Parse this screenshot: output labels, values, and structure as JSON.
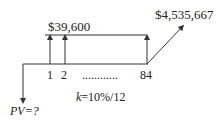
{
  "diagram": {
    "type": "cash-flow-timeline",
    "payment_label": "$39,600",
    "future_value_label": "$4,535,667",
    "periods": [
      "1",
      "2",
      "84"
    ],
    "ellipsis": "............",
    "rate_label_var": "k",
    "rate_label_value": "=10%/12",
    "pv_label": "PV=?",
    "colors": {
      "line": "#333333",
      "text": "#222222",
      "background": "#ffffff"
    }
  }
}
